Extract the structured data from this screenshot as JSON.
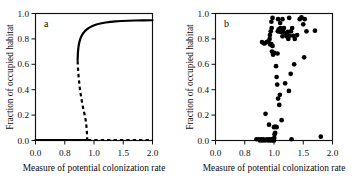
{
  "figure": {
    "background": "#ffffff",
    "ink": "#000000",
    "width": 361,
    "height": 186
  },
  "chart_data": [
    {
      "type": "line",
      "panel_label": "a",
      "title": "",
      "xlabel": "Measure of potential colonization rate",
      "ylabel": "Fraction of occupied habitat",
      "xlim": [
        0.0,
        2.0
      ],
      "ylim": [
        0.0,
        1.0
      ],
      "xticks": [
        0.0,
        0.5,
        1.0,
        1.5,
        2.0
      ],
      "xticklabels": [
        "0.0",
        "0.8",
        "1.0",
        "1.5",
        "2.0"
      ],
      "yticks": [
        0.0,
        0.2,
        0.4,
        0.6,
        0.8,
        1.0
      ],
      "yticklabels": [
        "0.0",
        "0.2",
        "0.4",
        "0.6",
        "0.8",
        "1.0"
      ],
      "grid": false,
      "legend": "none",
      "description": "Bifurcation diagram with a saddle-node (fold) at about x=0.72, y=0.63; an upper stable branch (solid), an unstable middle branch (dashed) falling to zero near x=0.88, a stable zero branch (solid) up to x=0.88, and an unstable zero branch (dashed) beyond.",
      "series": [
        {
          "name": "upper-stable-branch",
          "style": "solid",
          "points": [
            [
              0.72,
              0.632
            ],
            [
              0.726,
              0.7
            ],
            [
              0.736,
              0.742
            ],
            [
              0.75,
              0.775
            ],
            [
              0.768,
              0.803
            ],
            [
              0.79,
              0.826
            ],
            [
              0.815,
              0.845
            ],
            [
              0.845,
              0.861
            ],
            [
              0.88,
              0.876
            ],
            [
              0.92,
              0.889
            ],
            [
              0.965,
              0.9
            ],
            [
              1.015,
              0.909
            ],
            [
              1.07,
              0.917
            ],
            [
              1.13,
              0.923
            ],
            [
              1.2,
              0.929
            ],
            [
              1.28,
              0.934
            ],
            [
              1.37,
              0.938
            ],
            [
              1.47,
              0.941
            ],
            [
              1.58,
              0.943
            ],
            [
              1.7,
              0.945
            ],
            [
              1.83,
              0.946
            ],
            [
              2.0,
              0.947
            ]
          ]
        },
        {
          "name": "unstable-middle-branch",
          "style": "dashed",
          "points": [
            [
              0.72,
              0.625
            ],
            [
              0.726,
              0.57
            ],
            [
              0.734,
              0.52
            ],
            [
              0.744,
              0.47
            ],
            [
              0.756,
              0.42
            ],
            [
              0.77,
              0.372
            ],
            [
              0.786,
              0.325
            ],
            [
              0.804,
              0.279
            ],
            [
              0.824,
              0.234
            ],
            [
              0.846,
              0.19
            ],
            [
              0.862,
              0.148
            ],
            [
              0.872,
              0.105
            ],
            [
              0.879,
              0.062
            ],
            [
              0.883,
              0.02
            ],
            [
              0.885,
              0.004
            ]
          ]
        },
        {
          "name": "stable-zero-branch",
          "style": "solid",
          "points": [
            [
              0.0,
              0.004
            ],
            [
              0.885,
              0.004
            ]
          ]
        },
        {
          "name": "unstable-zero-branch",
          "style": "dashed",
          "points": [
            [
              0.895,
              0.004
            ],
            [
              2.0,
              0.004
            ]
          ]
        }
      ]
    },
    {
      "type": "scatter",
      "panel_label": "b",
      "title": "",
      "xlabel": "Measure of potential colonization rate",
      "ylabel": "Fraction of occupied habitat",
      "xlim": [
        0.0,
        2.0
      ],
      "ylim": [
        0.0,
        1.0
      ],
      "xticks": [
        0.0,
        0.5,
        1.0,
        1.5,
        2.0
      ],
      "xticklabels": [
        "0.0",
        "0.8",
        "1.0",
        "1.5",
        "2.0"
      ],
      "yticks": [
        0.0,
        0.2,
        0.4,
        0.6,
        0.8,
        1.0
      ],
      "yticklabels": [
        "0.0",
        "0.2",
        "0.4",
        "0.6",
        "0.8",
        "1.0"
      ],
      "grid": false,
      "legend": "none",
      "marker": "filled-circle",
      "description": "Empirical scatter of occupancy versus colonization-rate measure; points cluster near zero occupancy below x~1.0 and near high occupancy above x~1.0, with a scattered intermediate band.",
      "points": [
        [
          0.7,
          0.01
        ],
        [
          0.74,
          0.01
        ],
        [
          0.76,
          0.0
        ],
        [
          0.78,
          0.01
        ],
        [
          0.8,
          0.0
        ],
        [
          0.82,
          0.01
        ],
        [
          0.845,
          0.0
        ],
        [
          0.88,
          0.01
        ],
        [
          0.9,
          0.0
        ],
        [
          0.92,
          0.01
        ],
        [
          0.94,
          0.0
        ],
        [
          0.955,
          0.01
        ],
        [
          0.975,
          0.0
        ],
        [
          0.99,
          0.01
        ],
        [
          1.0,
          0.0
        ],
        [
          1.005,
          0.02
        ],
        [
          1.01,
          0.05
        ],
        [
          1.02,
          0.06
        ],
        [
          1.0,
          0.105
        ],
        [
          1.02,
          0.11
        ],
        [
          1.045,
          0.105
        ],
        [
          1.3,
          0.01
        ],
        [
          1.8,
          0.03
        ],
        [
          0.855,
          0.21
        ],
        [
          1.13,
          0.16
        ],
        [
          0.915,
          0.125
        ],
        [
          1.09,
          0.28
        ],
        [
          1.07,
          0.33
        ],
        [
          1.1,
          0.36
        ],
        [
          1.255,
          0.39
        ],
        [
          1.055,
          0.44
        ],
        [
          1.045,
          0.5
        ],
        [
          1.19,
          0.45
        ],
        [
          1.035,
          0.585
        ],
        [
          1.285,
          0.525
        ],
        [
          1.345,
          0.6
        ],
        [
          1.515,
          0.655
        ],
        [
          0.985,
          0.675
        ],
        [
          1.005,
          0.69
        ],
        [
          1.06,
          0.685
        ],
        [
          0.965,
          0.7
        ],
        [
          0.975,
          0.745
        ],
        [
          0.955,
          0.76
        ],
        [
          0.935,
          0.755
        ],
        [
          0.795,
          0.775
        ],
        [
          0.825,
          0.765
        ],
        [
          0.845,
          0.765
        ],
        [
          0.875,
          0.775
        ],
        [
          0.905,
          0.78
        ],
        [
          0.925,
          0.8
        ],
        [
          0.93,
          0.83
        ],
        [
          0.945,
          0.86
        ],
        [
          0.96,
          0.885
        ],
        [
          0.955,
          0.935
        ],
        [
          0.975,
          0.965
        ],
        [
          1.065,
          0.86
        ],
        [
          1.08,
          0.875
        ],
        [
          1.095,
          0.86
        ],
        [
          1.11,
          0.885
        ],
        [
          1.12,
          0.855
        ],
        [
          1.145,
          0.82
        ],
        [
          1.155,
          0.86
        ],
        [
          1.17,
          0.885
        ],
        [
          1.195,
          0.845
        ],
        [
          1.215,
          0.82
        ],
        [
          1.235,
          0.855
        ],
        [
          1.245,
          0.8
        ],
        [
          1.27,
          0.825
        ],
        [
          1.29,
          0.86
        ],
        [
          1.31,
          0.885
        ],
        [
          1.33,
          0.825
        ],
        [
          1.355,
          0.8
        ],
        [
          1.07,
          0.955
        ],
        [
          1.145,
          0.955
        ],
        [
          1.26,
          0.965
        ],
        [
          1.44,
          0.955
        ],
        [
          1.47,
          0.97
        ],
        [
          1.5,
          0.915
        ],
        [
          1.525,
          0.955
        ],
        [
          1.555,
          0.86
        ],
        [
          1.7,
          0.865
        ],
        [
          1.105,
          0.925
        ],
        [
          1.395,
          0.83
        ]
      ]
    }
  ]
}
